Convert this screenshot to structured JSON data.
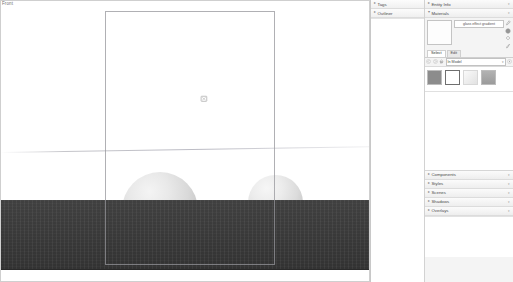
{
  "viewport": {
    "view_label": "Front",
    "ground_color": "#3b3b3b",
    "sphere_color": "#d9d9d9",
    "selection_outline_color": "#8f8f93",
    "cursor_icon": "paint-bucket-cursor"
  },
  "left_tray": {
    "panels": [
      {
        "title": "Tags",
        "collapsed": true,
        "expander": "▸"
      },
      {
        "title": "Outliner",
        "collapsed": true,
        "expander": "▸"
      }
    ]
  },
  "right_tray": {
    "entity_info": {
      "title": "Entity Info",
      "expander": "▸"
    },
    "materials": {
      "title": "Materials",
      "expander": "▾",
      "material_name": "glass effect gradient",
      "tabs": [
        {
          "label": "Select",
          "active": true
        },
        {
          "label": "Edit",
          "active": false
        }
      ],
      "library": "In Model",
      "library_caret": "▾",
      "nav_back_icon": "nav-back-icon",
      "nav_forward_icon": "nav-forward-icon",
      "home_icon": "home-icon",
      "details_icon": "details-arrow-icon",
      "tools": [
        "eyedropper-icon",
        "globe-icon",
        "paint-bucket-icon",
        "brush-icon"
      ],
      "swatches": [
        {
          "name": "gray-material",
          "color": "#8c8c8c",
          "selected": false
        },
        {
          "name": "white-material",
          "color": "#ffffff",
          "selected": true
        },
        {
          "name": "gradient-material",
          "color": "#ededed",
          "selected": false
        },
        {
          "name": "light-gray-material",
          "color": "#a8a8a8",
          "selected": false
        }
      ]
    },
    "collapsed_panels": [
      {
        "title": "Components",
        "expander": "▸"
      },
      {
        "title": "Styles",
        "expander": "▸"
      },
      {
        "title": "Scenes",
        "expander": "▸"
      },
      {
        "title": "Shadows",
        "expander": "▸"
      },
      {
        "title": "Overlays",
        "expander": "▸"
      }
    ]
  }
}
